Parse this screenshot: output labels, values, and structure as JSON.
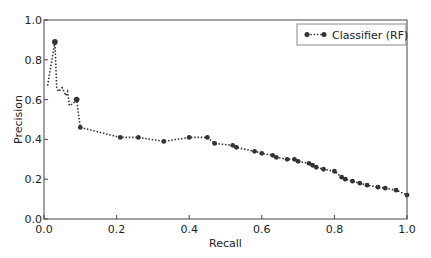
{
  "chart_data": {
    "type": "line",
    "title": "",
    "xlabel": "Recall",
    "ylabel": "Precision",
    "xlim": [
      0.0,
      1.0
    ],
    "ylim": [
      0.0,
      1.0
    ],
    "xticks": [
      "0.0",
      "0.2",
      "0.4",
      "0.6",
      "0.8",
      "1.0"
    ],
    "yticks": [
      "0.0",
      "0.2",
      "0.4",
      "0.6",
      "0.8",
      "1.0"
    ],
    "grid": false,
    "legend_position": "upper right",
    "series": [
      {
        "name": "Classifier (RF)",
        "color": "#333333",
        "linestyle": "dotted",
        "marker": "circle",
        "x": [
          0.01,
          0.03,
          0.035,
          0.04,
          0.05,
          0.06,
          0.065,
          0.07,
          0.08,
          0.09,
          0.1,
          0.21,
          0.26,
          0.33,
          0.4,
          0.45,
          0.47,
          0.52,
          0.53,
          0.58,
          0.6,
          0.63,
          0.64,
          0.67,
          0.69,
          0.7,
          0.73,
          0.74,
          0.75,
          0.77,
          0.8,
          0.82,
          0.83,
          0.85,
          0.87,
          0.89,
          0.92,
          0.94,
          0.97,
          1.0
        ],
        "y": [
          0.67,
          0.89,
          0.66,
          0.64,
          0.66,
          0.62,
          0.64,
          0.57,
          0.58,
          0.6,
          0.46,
          0.41,
          0.41,
          0.39,
          0.41,
          0.41,
          0.38,
          0.37,
          0.36,
          0.34,
          0.33,
          0.32,
          0.31,
          0.3,
          0.3,
          0.29,
          0.28,
          0.27,
          0.26,
          0.25,
          0.24,
          0.21,
          0.2,
          0.19,
          0.18,
          0.17,
          0.16,
          0.155,
          0.145,
          0.12
        ],
        "highlighted_points": [
          [
            0.03,
            0.89
          ],
          [
            0.09,
            0.6
          ]
        ]
      }
    ]
  },
  "legend": {
    "label": "Classifier (RF)"
  },
  "axes": {
    "x_label": "Recall",
    "y_label": "Precision"
  }
}
